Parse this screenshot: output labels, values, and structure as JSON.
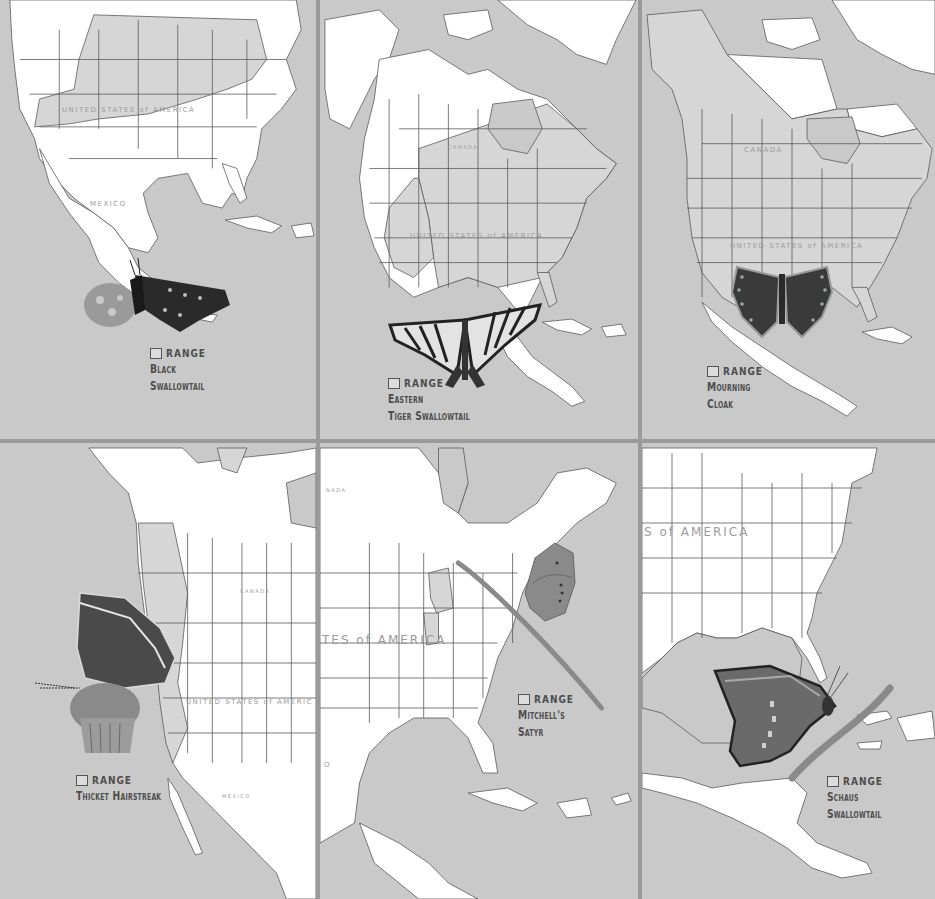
{
  "plate": {
    "colors": {
      "ocean": "#c9c9c9",
      "land_outside_range": "#ffffff",
      "range_land": "#d6d6d6",
      "border_lines": "#5a5a5a",
      "panel_divider": "#9a9a9a",
      "legend_text": "#4d4d4d",
      "map_label_text": "#9b9b9b"
    },
    "panels": [
      {
        "id": "black-swallowtail",
        "legend_range_label": "RANGE",
        "species_line1": "Black",
        "species_line2": "Swallowtail",
        "map_labels": [
          "UNITED STATES of AMERICA",
          "MEXICO"
        ]
      },
      {
        "id": "eastern-tiger-swallowtail",
        "legend_range_label": "RANGE",
        "species_line1": "Eastern",
        "species_line2": "Tiger Swallowtail",
        "map_labels": [
          "CANADA",
          "UNITED STATES of AMERICA"
        ]
      },
      {
        "id": "mourning-cloak",
        "legend_range_label": "RANGE",
        "species_line1": "Mourning",
        "species_line2": "Cloak",
        "map_labels": [
          "CANADA",
          "UNITED STATES of AMERICA"
        ]
      },
      {
        "id": "thicket-hairstreak",
        "legend_range_label": "RANGE",
        "species_line1": "Thicket Hairstreak",
        "species_line2": "",
        "map_labels": [
          "CANADA",
          "UNITED STATES of AMERIC",
          "MEXICO"
        ]
      },
      {
        "id": "mitchells-satyr",
        "legend_range_label": "RANGE",
        "species_line1": "Mitchell's",
        "species_line2": "Satyr",
        "map_labels": [
          "NADA",
          "TES of AMERICA",
          "O"
        ]
      },
      {
        "id": "schaus-swallowtail",
        "legend_range_label": "RANGE",
        "species_line1": "Schaus",
        "species_line2": "Swallowtail",
        "map_labels": [
          "S of AMERICA"
        ]
      }
    ]
  }
}
